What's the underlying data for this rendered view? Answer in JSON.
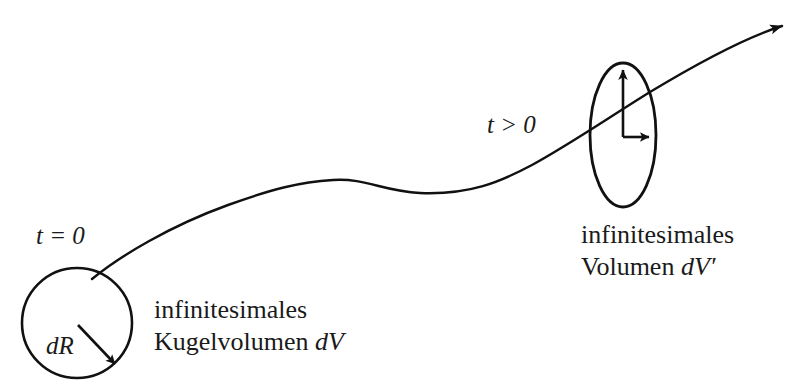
{
  "figure": {
    "type": "physics-diagram",
    "background_color": "#ffffff",
    "stroke_color": "#111111",
    "canvas": {
      "width": 807,
      "height": 389
    }
  },
  "labels": {
    "t_initial": "t = 0",
    "t_later": "t > 0",
    "radius": "dR",
    "left_caption_line1": "infinitesimales",
    "left_caption_line2_text": "Kugelvolumen ",
    "left_caption_line2_symbol": "dV",
    "right_caption_line1": "infinitesimales",
    "right_caption_line2_text": "Volumen ",
    "right_caption_line2_symbol": "dV",
    "right_caption_line2_prime": "′"
  },
  "shapes": {
    "circle": {
      "name": "infinitesimal-sphere",
      "center_x": 77,
      "center_y": 323,
      "radius": 55
    },
    "ellipse": {
      "name": "infinitesimal-ellipsoid",
      "center_x": 623,
      "center_y": 135,
      "radius_x": 33,
      "radius_y": 72
    },
    "radius_arrow": {
      "name": "dR-arrow",
      "from_x": 78,
      "from_y": 325,
      "to_x": 115,
      "to_y": 364
    },
    "vertical_arrow": {
      "name": "ellipse-major-axis-arrow",
      "from_x": 623,
      "from_y": 137,
      "to_x": 623,
      "to_y": 65
    },
    "horizontal_arrow": {
      "name": "ellipse-minor-axis-arrow",
      "from_x": 623,
      "from_y": 137,
      "to_x": 654,
      "to_y": 137
    },
    "worldline": {
      "name": "trajectory-curve",
      "start_x": 92,
      "start_y": 279,
      "end_x": 786,
      "end_y": 24,
      "has_arrowhead": true
    }
  }
}
